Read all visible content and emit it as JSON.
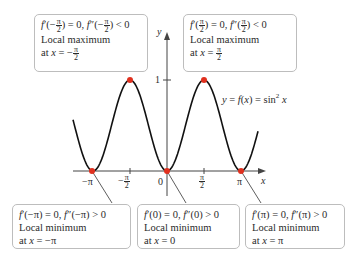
{
  "figure": {
    "curve_label": "y = f(x) = sin² x",
    "axis_labels": {
      "x": "x",
      "y": "y"
    },
    "x_ticks": [
      "−π",
      "−π/2",
      "0",
      "π/2",
      "π"
    ],
    "y_ticks": [
      "1"
    ],
    "colors": {
      "curve": "#111111",
      "axis": "#444444",
      "points": "#e0301e",
      "box_border": "#bdbdbd",
      "leader": "#333333"
    }
  },
  "annotations": [
    {
      "id": "max-neg-half-pi",
      "eq_left": "f′(−π/2) = 0, f″(−π/2) < 0",
      "type": "Local maximum",
      "at": "at x = −π/2"
    },
    {
      "id": "max-half-pi",
      "eq_left": "f′(π/2) = 0, f″(π/2) < 0",
      "type": "Local maximum",
      "at": "at x = π/2"
    },
    {
      "id": "min-neg-pi",
      "eq_left": "f′(−π) = 0, f″(−π) > 0",
      "type": "Local minimum",
      "at": "at x = −π"
    },
    {
      "id": "min-zero",
      "eq_left": "f′(0) = 0, f″(0) > 0",
      "type": "Local minimum",
      "at": "at x = 0"
    },
    {
      "id": "min-pi",
      "eq_left": "f′(π) = 0, f″(π) > 0",
      "type": "Local minimum",
      "at": "at x = π"
    }
  ],
  "chart_data": {
    "type": "line",
    "xlabel": "x",
    "ylabel": "y",
    "x_tick_labels": [
      "−π",
      "−π/2",
      "0",
      "π/2",
      "π"
    ],
    "x_tick_values": [
      -3.1416,
      -1.5708,
      0,
      1.5708,
      3.1416
    ],
    "y_tick_labels": [
      "1"
    ],
    "y_tick_values": [
      1
    ],
    "xlim": [
      -4.0,
      3.9
    ],
    "ylim": [
      0,
      1.1
    ],
    "series": [
      {
        "name": "sin^2 x",
        "function": "sin(x)^2"
      }
    ],
    "critical_points": [
      {
        "x": -3.1416,
        "y": 0,
        "kind": "local minimum"
      },
      {
        "x": -1.5708,
        "y": 1,
        "kind": "local maximum"
      },
      {
        "x": 0,
        "y": 0,
        "kind": "local minimum"
      },
      {
        "x": 1.5708,
        "y": 1,
        "kind": "local maximum"
      },
      {
        "x": 3.1416,
        "y": 0,
        "kind": "local minimum"
      }
    ],
    "grid": false,
    "legend": "none"
  }
}
